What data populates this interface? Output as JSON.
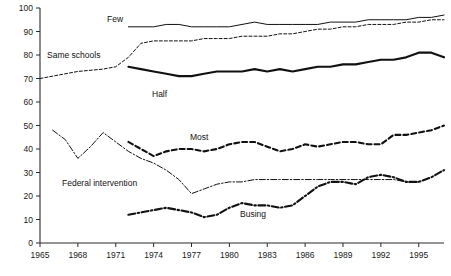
{
  "chart_data": {
    "type": "line",
    "title": "",
    "subtitle": "",
    "xlabel": "",
    "ylabel": "",
    "xlim": [
      1965,
      1997
    ],
    "ylim": [
      0,
      100
    ],
    "grid": false,
    "legend_position": "inline-annotations",
    "y_ticks": [
      0,
      10,
      20,
      30,
      40,
      50,
      60,
      70,
      80,
      90,
      100
    ],
    "y_tick_labels": [
      "0",
      "10",
      "20",
      "30",
      "40",
      "50",
      "60",
      "70",
      "80",
      "90",
      "100"
    ],
    "x_ticks": [
      1965,
      1968,
      1971,
      1974,
      1977,
      1980,
      1983,
      1986,
      1989,
      1992,
      1995
    ],
    "x_tick_labels": [
      "1965",
      "1968",
      "1971",
      "1974",
      "1977",
      "1980",
      "1983",
      "1989",
      "1989",
      "1992",
      "1995"
    ],
    "series": [
      {
        "name": "Few",
        "label": "Few",
        "style": "solid-thin",
        "x": [
          1972,
          1973,
          1974,
          1975,
          1976,
          1977,
          1978,
          1979,
          1980,
          1981,
          1982,
          1983,
          1984,
          1985,
          1986,
          1987,
          1988,
          1989,
          1990,
          1991,
          1992,
          1993,
          1994,
          1995,
          1996,
          1997
        ],
        "values": [
          92,
          92,
          92,
          93,
          93,
          92,
          92,
          92,
          92,
          93,
          94,
          93,
          93,
          93,
          93,
          93,
          94,
          94,
          94,
          95,
          95,
          95,
          95,
          96,
          96,
          97
        ]
      },
      {
        "name": "Same schools",
        "label": "Same schools",
        "style": "dashed-thin",
        "x": [
          1965,
          1968,
          1970,
          1971,
          1972,
          1973,
          1974,
          1975,
          1976,
          1977,
          1978,
          1979,
          1980,
          1981,
          1982,
          1983,
          1984,
          1985,
          1986,
          1987,
          1988,
          1989,
          1990,
          1991,
          1992,
          1993,
          1994,
          1995,
          1996,
          1997
        ],
        "values": [
          70,
          73,
          74,
          75,
          79,
          85,
          86,
          86,
          86,
          86,
          87,
          87,
          87,
          88,
          88,
          88,
          89,
          89,
          90,
          91,
          91,
          92,
          92,
          93,
          93,
          93,
          94,
          94,
          95,
          95
        ]
      },
      {
        "name": "Half",
        "label": "Half",
        "style": "solid-bold",
        "x": [
          1972,
          1973,
          1974,
          1975,
          1976,
          1977,
          1978,
          1979,
          1980,
          1981,
          1982,
          1983,
          1984,
          1985,
          1986,
          1987,
          1988,
          1989,
          1990,
          1991,
          1992,
          1993,
          1994,
          1995,
          1996,
          1997
        ],
        "values": [
          75,
          74,
          73,
          72,
          71,
          71,
          72,
          73,
          73,
          73,
          74,
          73,
          74,
          73,
          74,
          75,
          75,
          76,
          76,
          77,
          78,
          78,
          79,
          81,
          81,
          79
        ]
      },
      {
        "name": "Most",
        "label": "Most",
        "style": "dashed-bold",
        "x": [
          1972,
          1973,
          1974,
          1975,
          1976,
          1977,
          1978,
          1979,
          1980,
          1981,
          1982,
          1983,
          1984,
          1985,
          1986,
          1987,
          1988,
          1989,
          1990,
          1991,
          1992,
          1993,
          1994,
          1995,
          1996,
          1997
        ],
        "values": [
          43,
          40,
          37,
          39,
          40,
          40,
          39,
          40,
          42,
          43,
          43,
          41,
          39,
          40,
          42,
          41,
          42,
          43,
          43,
          42,
          42,
          46,
          46,
          47,
          48,
          50
        ]
      },
      {
        "name": "Federal intervention",
        "label": "Federal intervention",
        "style": "dashdot-thin",
        "x": [
          1966,
          1967,
          1968,
          1969,
          1970,
          1971,
          1972,
          1973,
          1974,
          1975,
          1976,
          1977,
          1978,
          1979,
          1980,
          1981,
          1982,
          1983,
          1984,
          1985,
          1986,
          1987,
          1988,
          1989,
          1990,
          1991,
          1992,
          1993,
          1994,
          1995
        ],
        "values": [
          48,
          44,
          36,
          41,
          47,
          43,
          39,
          36,
          34,
          31,
          27,
          21,
          23,
          25,
          26,
          26,
          27,
          27,
          27,
          27,
          27,
          27,
          27,
          27,
          27,
          27,
          27,
          27,
          26,
          26
        ]
      },
      {
        "name": "Busing",
        "label": "Busing",
        "style": "dashdot-bold",
        "x": [
          1972,
          1973,
          1974,
          1975,
          1976,
          1977,
          1978,
          1979,
          1980,
          1981,
          1982,
          1983,
          1984,
          1985,
          1986,
          1987,
          1988,
          1989,
          1990,
          1991,
          1992,
          1993,
          1994,
          1995,
          1996,
          1997
        ],
        "values": [
          12,
          13,
          14,
          15,
          14,
          13,
          11,
          12,
          15,
          17,
          16,
          16,
          15,
          16,
          20,
          24,
          26,
          26,
          25,
          28,
          29,
          28,
          26,
          26,
          28,
          31
        ]
      }
    ]
  },
  "annotations": {
    "few": "Few",
    "same_schools": "Same schools",
    "half": "Half",
    "most": "Most",
    "federal_intervention": "Federal intervention",
    "busing": "Busing"
  }
}
